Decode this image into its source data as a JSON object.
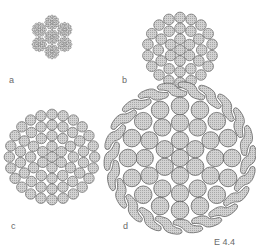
{
  "figure": {
    "id_label": "E 4.4",
    "panels": [
      {
        "key": "a",
        "label": "a",
        "description": "six-strand wire rope cross-section",
        "cx": 52,
        "cy": 37,
        "r": 22
      },
      {
        "key": "b",
        "label": "b",
        "description": "round-wire bundle",
        "cx": 180,
        "cy": 50,
        "r": 38
      },
      {
        "key": "c",
        "label": "c",
        "description": "larger round-wire bundle",
        "cx": 52,
        "cy": 157,
        "r": 48
      },
      {
        "key": "d",
        "label": "d",
        "description": "locked-coil cable with Z-shaped outer wires",
        "cx": 180,
        "cy": 158,
        "r": 76
      }
    ]
  },
  "colors": {
    "stroke": "#555555",
    "fill": "#cfcfcf",
    "hatch": "#9a9a9a",
    "label": "#6a6a6a"
  }
}
